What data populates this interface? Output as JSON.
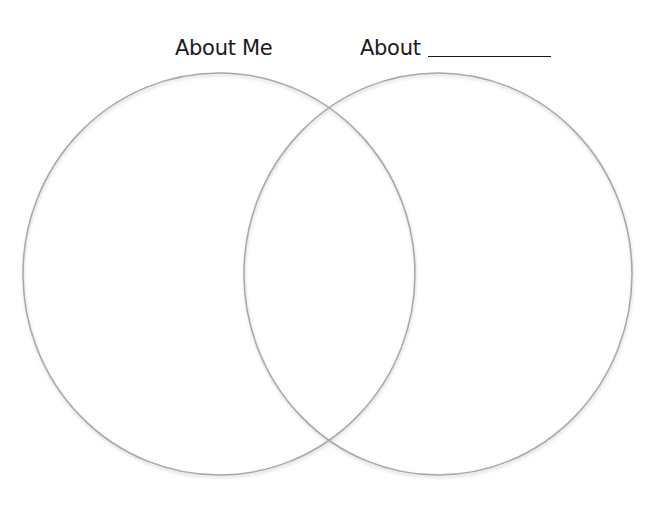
{
  "diagram": {
    "type": "venn",
    "sets": [
      {
        "id": "left",
        "label": "About Me",
        "cx": 219,
        "cy": 274,
        "rx": 196,
        "ry": 201
      },
      {
        "id": "right",
        "label": "About",
        "has_blank": true,
        "cx": 438,
        "cy": 274,
        "rx": 194,
        "ry": 201
      }
    ],
    "stroke_color": "#a8a8a8",
    "shadow_color": "#c4c4c4",
    "background": "#ffffff",
    "text_color": "#1a1a1a"
  }
}
